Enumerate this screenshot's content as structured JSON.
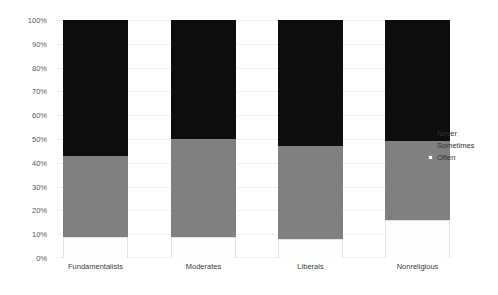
{
  "chart_data": {
    "type": "bar",
    "stacked": true,
    "stack_mode": "percent",
    "title": "",
    "subtitle": "",
    "xlabel": "",
    "ylabel": "",
    "ylim": [
      0,
      100
    ],
    "grid": true,
    "legend_position": "right",
    "categories": [
      "Fundamentalists",
      "Moderates",
      "Liberals",
      "Nonreligious"
    ],
    "ytick_labels": [
      "0%",
      "10%",
      "20%",
      "30%",
      "40%",
      "50%",
      "60%",
      "70%",
      "80%",
      "90%",
      "100%"
    ],
    "ytick_values": [
      0,
      10,
      20,
      30,
      40,
      50,
      60,
      70,
      80,
      90,
      100
    ],
    "series": [
      {
        "name": "Often",
        "color": "#ffffff",
        "stack_order": 0,
        "values": [
          9,
          9,
          8,
          16
        ]
      },
      {
        "name": "Sometimes",
        "color": "#808080",
        "stack_order": 1,
        "values": [
          34,
          41,
          39,
          33
        ]
      },
      {
        "name": "Never",
        "color": "#0d0d0d",
        "stack_order": 2,
        "values": [
          57,
          50,
          53,
          51
        ]
      }
    ]
  },
  "legend": {
    "entries": [
      {
        "label": "Never",
        "swatch": "never-swatch-icon"
      },
      {
        "label": "Sometimes",
        "swatch": "sometimes-swatch-icon"
      },
      {
        "label": "Often",
        "swatch": "often-swatch-icon"
      }
    ]
  },
  "colors": {
    "never": "#0d0d0d",
    "sometimes": "#808080",
    "often": "#ffffff",
    "grid": "#f2f2f2",
    "text": "#404040",
    "background": "#ffffff"
  }
}
